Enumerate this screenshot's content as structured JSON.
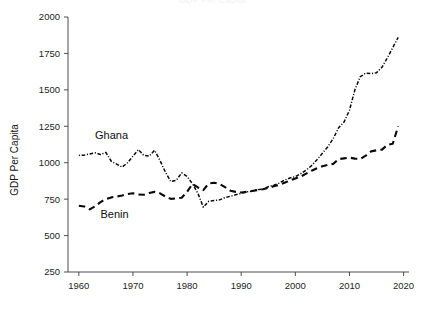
{
  "chart_data": {
    "type": "line",
    "title": "GDP Per Capita",
    "xlabel": "",
    "ylabel": "GDP Per Capita",
    "xlim": [
      1958,
      2021
    ],
    "ylim": [
      250,
      2000
    ],
    "xticks": [
      1960,
      1970,
      1980,
      1990,
      2000,
      2010,
      2020
    ],
    "xtick_labels": [
      "1960",
      "1970",
      "1980",
      "1990",
      "2000",
      "2010",
      "2020"
    ],
    "yticks": [
      250,
      500,
      750,
      1000,
      1250,
      1500,
      1750,
      2000
    ],
    "ytick_labels": [
      "250",
      "500",
      "750",
      "1000",
      "1250",
      "1500",
      "1750",
      "2000"
    ],
    "grid": false,
    "legend_position": "inline-annotations",
    "x": [
      1960,
      1961,
      1962,
      1963,
      1964,
      1965,
      1966,
      1967,
      1968,
      1969,
      1970,
      1971,
      1972,
      1973,
      1974,
      1975,
      1976,
      1977,
      1978,
      1979,
      1980,
      1981,
      1982,
      1983,
      1984,
      1985,
      1986,
      1987,
      1988,
      1989,
      1990,
      1991,
      1992,
      1993,
      1994,
      1995,
      1996,
      1997,
      1998,
      1999,
      2000,
      2001,
      2002,
      2003,
      2004,
      2005,
      2006,
      2007,
      2008,
      2009,
      2010,
      2011,
      2012,
      2013,
      2014,
      2015,
      2016,
      2017,
      2018,
      2019
    ],
    "series": [
      {
        "name": "Ghana",
        "style": "dash-dot",
        "color": "#0a0a0a",
        "label_x": 1963,
        "label_y": 1160,
        "values": [
          1050,
          1052,
          1060,
          1068,
          1056,
          1070,
          1010,
          990,
          970,
          1000,
          1045,
          1090,
          1050,
          1045,
          1085,
          1015,
          935,
          870,
          880,
          930,
          905,
          855,
          790,
          695,
          735,
          740,
          745,
          760,
          770,
          780,
          790,
          800,
          805,
          815,
          820,
          835,
          845,
          860,
          880,
          895,
          905,
          925,
          950,
          980,
          1020,
          1065,
          1110,
          1165,
          1240,
          1280,
          1360,
          1500,
          1590,
          1615,
          1612,
          1618,
          1655,
          1720,
          1790,
          1860
        ]
      },
      {
        "name": "Benin",
        "style": "dashed",
        "color": "#0a0a0a",
        "label_x": 1964,
        "label_y": 618,
        "values": [
          705,
          700,
          680,
          700,
          730,
          750,
          762,
          768,
          775,
          785,
          790,
          782,
          780,
          792,
          800,
          790,
          768,
          752,
          755,
          760,
          800,
          855,
          830,
          812,
          858,
          862,
          855,
          832,
          808,
          800,
          796,
          800,
          806,
          812,
          818,
          828,
          838,
          848,
          862,
          878,
          892,
          905,
          925,
          945,
          962,
          975,
          985,
          992,
          1025,
          1030,
          1035,
          1028,
          1026,
          1048,
          1078,
          1085,
          1090,
          1122,
          1130,
          1250
        ]
      }
    ]
  },
  "axes": {
    "y_axis_title": "GDP Per Capita"
  },
  "annotations": [
    {
      "text": "Ghana",
      "series": "Ghana"
    },
    {
      "text": "Benin",
      "series": "Benin"
    }
  ]
}
